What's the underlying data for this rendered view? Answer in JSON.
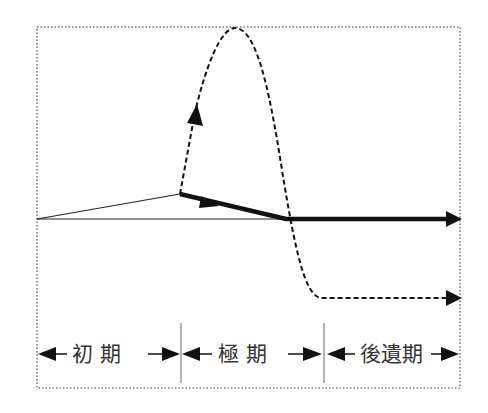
{
  "diagram": {
    "type": "phase-course-diagram",
    "phases": [
      {
        "label": "初 期",
        "x_start": 37,
        "x_end": 181
      },
      {
        "label": "極 期",
        "x_start": 181,
        "x_end": 324
      },
      {
        "label": "後遺期",
        "x_start": 324,
        "x_end": 460
      }
    ],
    "lines": [
      {
        "name": "baseline",
        "style": "thin-solid"
      },
      {
        "name": "initial-rise",
        "style": "thin-solid"
      },
      {
        "name": "mild-course",
        "style": "thick-solid-arrow"
      },
      {
        "name": "severe-course",
        "style": "dashed-arrow"
      }
    ],
    "colors": {
      "line": "#111111",
      "border": "#777777",
      "text": "#333333"
    }
  }
}
